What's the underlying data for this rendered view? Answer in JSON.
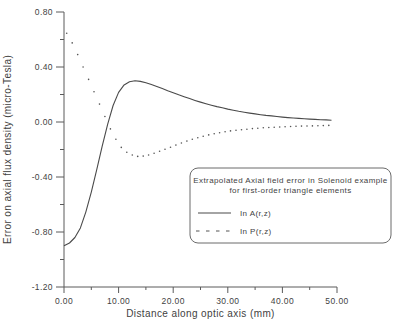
{
  "chart_data": {
    "type": "line",
    "title": "",
    "xlabel": "Distance along optic axis (mm)",
    "ylabel": "Error on axial flux density (micro-Tesla)",
    "xlim": [
      0,
      50
    ],
    "ylim": [
      -1.2,
      0.8
    ],
    "grid": false,
    "x_major_ticks": [
      0,
      10,
      20,
      30,
      40,
      50
    ],
    "x_minor_ticks": [
      5,
      15,
      25,
      35,
      45
    ],
    "x_tick_labels": [
      "0.00",
      "10.00",
      "20.00",
      "30.00",
      "40.00",
      "50.00"
    ],
    "y_major_ticks": [
      0.8,
      0.4,
      0.0,
      -0.4,
      -0.8,
      -1.2
    ],
    "y_minor_ticks": [
      0.6,
      0.2,
      -0.2,
      -0.6,
      -1.0
    ],
    "y_tick_labels": [
      "0.80",
      "0.40",
      "0.00",
      "-0.40",
      "-0.80",
      "-1.20"
    ],
    "legend": {
      "position": "lower-right",
      "title_line1": "Extrapolated Axial field error in Solenoid example",
      "title_line2": "for first-order triangle elements",
      "entries": [
        {
          "label": "In A(r,z)",
          "style": "solid"
        },
        {
          "label": "In P(r,z)",
          "style": "dotted"
        }
      ]
    },
    "series": [
      {
        "name": "In A(r,z)",
        "style": "solid",
        "x": [
          0,
          1,
          2,
          3,
          4,
          5,
          6,
          7,
          8,
          9,
          10,
          11,
          12,
          13,
          14,
          15,
          16,
          17,
          18,
          19,
          20,
          21,
          22,
          23,
          24,
          25,
          26,
          27,
          28,
          29,
          30,
          31,
          32,
          33,
          34,
          35,
          36,
          37,
          38,
          39,
          40,
          41,
          42,
          43,
          44,
          45,
          46,
          47,
          48,
          49
        ],
        "y": [
          -0.9,
          -0.88,
          -0.84,
          -0.77,
          -0.655,
          -0.51,
          -0.345,
          -0.175,
          -0.015,
          0.12,
          0.215,
          0.27,
          0.292,
          0.3,
          0.295,
          0.285,
          0.272,
          0.258,
          0.243,
          0.228,
          0.213,
          0.198,
          0.184,
          0.17,
          0.157,
          0.145,
          0.133,
          0.122,
          0.112,
          0.103,
          0.094,
          0.086,
          0.078,
          0.071,
          0.065,
          0.059,
          0.053,
          0.048,
          0.044,
          0.04,
          0.036,
          0.032,
          0.029,
          0.026,
          0.023,
          0.021,
          0.019,
          0.017,
          0.015,
          0.013
        ]
      },
      {
        "name": "In P(r,z)",
        "style": "dotted",
        "x": [
          0.5,
          1.5,
          2.5,
          3.5,
          4.5,
          5.5,
          6.5,
          7.5,
          8.5,
          9.5,
          10.5,
          11.5,
          12.5,
          13.5,
          14.5,
          15.5,
          16.5,
          17.5,
          18.5,
          19.5,
          20.5,
          21.5,
          22.5,
          23.5,
          24.5,
          25.5,
          26.5,
          27.5,
          28.5,
          29.5,
          30.5,
          31.5,
          32.5,
          33.5,
          34.5,
          35.5,
          36.5,
          37.5,
          38.5,
          39.5,
          40.5,
          41.5,
          42.5,
          43.5,
          44.5,
          45.5,
          46.5,
          47.5,
          48.5
        ],
        "y": [
          0.645,
          0.575,
          0.49,
          0.4,
          0.31,
          0.22,
          0.13,
          0.04,
          -0.05,
          -0.125,
          -0.185,
          -0.22,
          -0.24,
          -0.25,
          -0.248,
          -0.24,
          -0.228,
          -0.213,
          -0.198,
          -0.183,
          -0.168,
          -0.153,
          -0.139,
          -0.126,
          -0.114,
          -0.103,
          -0.094,
          -0.086,
          -0.078,
          -0.071,
          -0.065,
          -0.06,
          -0.056,
          -0.052,
          -0.048,
          -0.045,
          -0.042,
          -0.04,
          -0.038,
          -0.036,
          -0.034,
          -0.033,
          -0.031,
          -0.03,
          -0.029,
          -0.028,
          -0.027,
          -0.026,
          -0.025
        ]
      }
    ],
    "colors": {
      "background": "#ffffff",
      "axis": "#5a5a5a",
      "text": "#3f3f3f",
      "solid_line": "#4a4a4a",
      "dots": "#555555",
      "legend_border": "#6b6b6b"
    }
  }
}
